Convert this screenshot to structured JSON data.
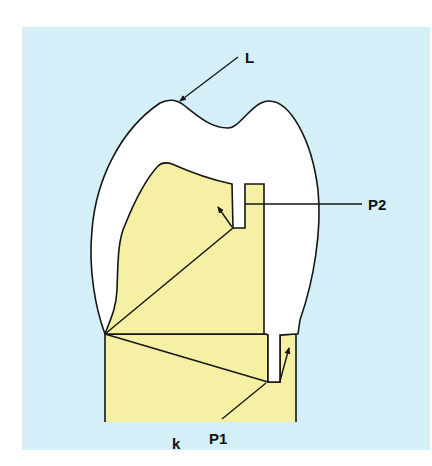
{
  "figure": {
    "type": "dental crown cross-section diagram",
    "colors": {
      "background_panel": "#d4eff7",
      "crown_fill": "#ffffff",
      "core_fill": "#f6f0a4",
      "stroke": "#151515"
    },
    "labels": {
      "L": "L",
      "P2": "P2",
      "P1": "P1",
      "k": "k"
    }
  }
}
